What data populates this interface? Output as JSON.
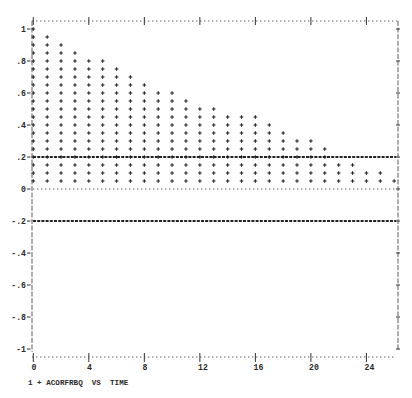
{
  "chart_data": {
    "type": "bar",
    "style": "lineprinter-plus-stack",
    "title": "",
    "xlabel": "TIME",
    "ylabel": "ACORFRBQ",
    "legend_text": "1 + ACORFRBQ  VS  TIME",
    "legend": [
      {
        "index": "1",
        "symbol": "+",
        "label": "ACORFRBQ VS TIME"
      }
    ],
    "x": [
      0,
      1,
      2,
      3,
      4,
      5,
      6,
      7,
      8,
      9,
      10,
      11,
      12,
      13,
      14,
      15,
      16,
      17,
      18,
      19,
      20,
      21,
      22,
      23,
      24,
      25,
      26
    ],
    "values": [
      1.0,
      0.95,
      0.9,
      0.85,
      0.8,
      0.8,
      0.75,
      0.7,
      0.65,
      0.6,
      0.6,
      0.55,
      0.5,
      0.5,
      0.45,
      0.45,
      0.45,
      0.4,
      0.35,
      0.3,
      0.3,
      0.25,
      0.15,
      0.15,
      0.1,
      0.1,
      0.05
    ],
    "mark_step": 0.05,
    "xlim": [
      0,
      26
    ],
    "ylim": [
      -1,
      1
    ],
    "xticks": [
      0,
      4,
      8,
      12,
      16,
      20,
      24
    ],
    "xtick_labels": [
      "0",
      "4",
      "8",
      "12",
      "16",
      "20",
      "24"
    ],
    "yticks": [
      1,
      0.8,
      0.6,
      0.4,
      0.2,
      0,
      -0.2,
      -0.4,
      -0.6,
      -0.8,
      -1
    ],
    "ytick_labels": [
      "1",
      ".8",
      ".6",
      ".4",
      ".2",
      "0",
      "-.2",
      "-.4",
      "-.6",
      "-.8",
      "-1"
    ],
    "reference_lines": [
      {
        "y": 0.2,
        "style": "dashed"
      },
      {
        "y": 0,
        "style": "dotted"
      },
      {
        "y": -0.2,
        "style": "dashed"
      }
    ],
    "grid": false,
    "legend_position": "bottom-left"
  },
  "colors": {
    "background": "#ffffff",
    "ink": "#222222"
  }
}
